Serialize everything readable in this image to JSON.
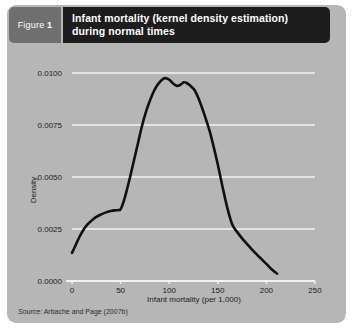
{
  "figure": {
    "number_prefix": "Figure",
    "number": "1",
    "title_line1": "Infant mortality (kernel density estimation)",
    "title_line2": "during normal times",
    "source_prefix": "Source:",
    "source_text": "Arbache and Page (2007b)"
  },
  "colors": {
    "panel_background": "#b6b6b6",
    "figure_number_block": "#6f6f6f",
    "title_block": "#1d1d1d",
    "gridline": "#f2f2f2",
    "curve": "#101010",
    "text": "#1c1c1c"
  },
  "chart_data": {
    "type": "line",
    "xlabel": "Infant mortality (per 1,000)",
    "ylabel": "Density",
    "xlim": [
      0,
      250
    ],
    "ylim": [
      0,
      0.01
    ],
    "xticks": [
      0,
      50,
      100,
      150,
      200,
      250
    ],
    "xtick_labels": [
      "0",
      "50",
      "100",
      "150",
      "200",
      "250"
    ],
    "yticks": [
      0.0,
      0.0025,
      0.005,
      0.0075,
      0.01
    ],
    "ytick_labels": [
      "0.0000",
      "0.0025",
      "0.0050",
      "0.0075",
      "0.0100"
    ],
    "grid": "horizontal",
    "legend": "none",
    "series": [
      {
        "name": "Density",
        "x": [
          0,
          4,
          8,
          12,
          16,
          20,
          25,
          30,
          35,
          40,
          45,
          48,
          50,
          53,
          56,
          60,
          64,
          68,
          72,
          76,
          80,
          85,
          90,
          95,
          100,
          104,
          108,
          112,
          115,
          118,
          122,
          126,
          130,
          134,
          138,
          142,
          146,
          150,
          155,
          160,
          165,
          170,
          175,
          180,
          185,
          190,
          195,
          200,
          205,
          211
        ],
        "y": [
          0.00135,
          0.00175,
          0.00215,
          0.00248,
          0.00272,
          0.0029,
          0.00308,
          0.0032,
          0.0033,
          0.00337,
          0.0034,
          0.00341,
          0.00345,
          0.0038,
          0.0043,
          0.00505,
          0.00585,
          0.00665,
          0.00745,
          0.00812,
          0.00865,
          0.0092,
          0.00955,
          0.00975,
          0.00968,
          0.0095,
          0.00938,
          0.00945,
          0.00955,
          0.00952,
          0.00938,
          0.00918,
          0.0088,
          0.0083,
          0.00775,
          0.00715,
          0.0064,
          0.0056,
          0.0045,
          0.00348,
          0.0027,
          0.00235,
          0.00205,
          0.00178,
          0.00152,
          0.00128,
          0.00105,
          0.00082,
          0.00058,
          0.00035
        ]
      }
    ]
  }
}
